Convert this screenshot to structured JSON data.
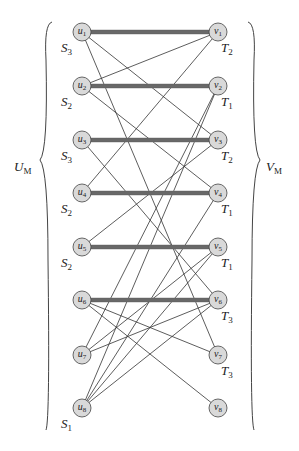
{
  "diagram": {
    "left_set_label": {
      "main": "U",
      "sub": "M"
    },
    "right_set_label": {
      "main": "V",
      "sub": "M"
    },
    "left_nodes": [
      {
        "id": "u1",
        "main": "u",
        "sub": "1",
        "y": 32,
        "group": {
          "main": "S",
          "sub": "3"
        }
      },
      {
        "id": "u2",
        "main": "u",
        "sub": "2",
        "y": 86,
        "group": {
          "main": "S",
          "sub": "2"
        }
      },
      {
        "id": "u3",
        "main": "u",
        "sub": "3",
        "y": 140,
        "group": {
          "main": "S",
          "sub": "3"
        }
      },
      {
        "id": "u4",
        "main": "u",
        "sub": "4",
        "y": 193,
        "group": {
          "main": "S",
          "sub": "2"
        }
      },
      {
        "id": "u5",
        "main": "u",
        "sub": "5",
        "y": 247,
        "group": {
          "main": "S",
          "sub": "2"
        }
      },
      {
        "id": "u6",
        "main": "u",
        "sub": "6",
        "y": 300,
        "group": null
      },
      {
        "id": "u7",
        "main": "u",
        "sub": "7",
        "y": 355,
        "group": null
      },
      {
        "id": "u8",
        "main": "u",
        "sub": "8",
        "y": 408,
        "group": {
          "main": "S",
          "sub": "1"
        }
      }
    ],
    "right_nodes": [
      {
        "id": "v1",
        "main": "v",
        "sub": "1",
        "y": 32,
        "group": {
          "main": "T",
          "sub": "2"
        }
      },
      {
        "id": "v2",
        "main": "v",
        "sub": "2",
        "y": 86,
        "group": {
          "main": "T",
          "sub": "1"
        }
      },
      {
        "id": "v3",
        "main": "v",
        "sub": "3",
        "y": 140,
        "group": {
          "main": "T",
          "sub": "2"
        }
      },
      {
        "id": "v4",
        "main": "v",
        "sub": "4",
        "y": 193,
        "group": {
          "main": "T",
          "sub": "1"
        }
      },
      {
        "id": "v5",
        "main": "v",
        "sub": "5",
        "y": 247,
        "group": {
          "main": "T",
          "sub": "1"
        }
      },
      {
        "id": "v6",
        "main": "v",
        "sub": "6",
        "y": 300,
        "group": {
          "main": "T",
          "sub": "3"
        }
      },
      {
        "id": "v7",
        "main": "v",
        "sub": "7",
        "y": 355,
        "group": {
          "main": "T",
          "sub": "3"
        }
      },
      {
        "id": "v8",
        "main": "v",
        "sub": "8",
        "y": 408,
        "group": null
      }
    ],
    "matching_edges": [
      [
        1,
        1
      ],
      [
        2,
        2
      ],
      [
        3,
        3
      ],
      [
        4,
        4
      ],
      [
        5,
        5
      ],
      [
        6,
        6
      ]
    ],
    "other_edges": [
      [
        1,
        3
      ],
      [
        1,
        7
      ],
      [
        2,
        1
      ],
      [
        2,
        4
      ],
      [
        3,
        6
      ],
      [
        4,
        1
      ],
      [
        5,
        3
      ],
      [
        6,
        7
      ],
      [
        6,
        8
      ],
      [
        7,
        2
      ],
      [
        7,
        5
      ],
      [
        7,
        6
      ],
      [
        8,
        2
      ],
      [
        8,
        4
      ],
      [
        8,
        5
      ],
      [
        8,
        6
      ]
    ],
    "colors": {
      "node_fill": "#d9d9d9",
      "stroke": "#333333",
      "matching": "#555555"
    }
  }
}
